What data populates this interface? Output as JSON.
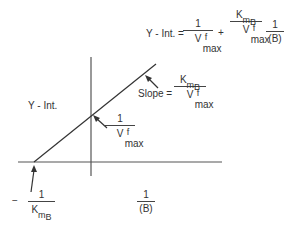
{
  "equation": {
    "lhs": "Y - Int. =",
    "term1": {
      "num": "1",
      "den_base": "V",
      "den_sup": "f",
      "den_sub": "max"
    },
    "plus": "+",
    "term2": {
      "num_base": "K",
      "num_sub": "m",
      "num_subsub": "B",
      "den_base": "V",
      "den_sup": "f",
      "den_sub": "max"
    },
    "term3": {
      "num": "1",
      "den": "(B)"
    }
  },
  "labels": {
    "y_int": "Y - Int.",
    "slope_prefix": "Slope =",
    "slope": {
      "num_base": "K",
      "num_sub": "m",
      "num_subsub": "B",
      "den_base": "V",
      "den_sup": "f",
      "den_sub": "max"
    },
    "intercept_y": {
      "num": "1",
      "den_base": "V",
      "den_sup": "f",
      "den_sub": "max"
    },
    "intercept_x": {
      "sign": "−",
      "num": "1",
      "den_base": "K",
      "den_sub": "m",
      "den_subsub": "B"
    },
    "x_axis": {
      "num": "1",
      "den": "(B)"
    }
  },
  "colors": {
    "line": "#333333",
    "axis": "#555555"
  }
}
